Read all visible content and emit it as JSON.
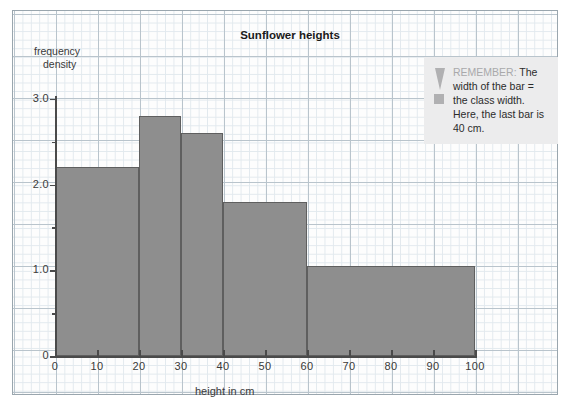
{
  "chart_data": {
    "type": "bar",
    "title": "Sunflower heights",
    "xlabel": "height in cm",
    "ylabel": "frequency density",
    "ylabel_line1": "frequency",
    "ylabel_line2": "density",
    "xlim": [
      0,
      100
    ],
    "ylim": [
      0,
      3.2
    ],
    "grid": true,
    "legend": "none",
    "bar_color": "#8e8e8e",
    "bar_edge_color": "#5f5f5f",
    "grid_major_color": "#b9c4cc",
    "grid_minor_color": "#e2e9ee",
    "x_ticks": [
      0,
      10,
      20,
      30,
      40,
      50,
      60,
      70,
      80,
      90,
      100
    ],
    "x_tick_labels": [
      "0",
      "10",
      "20",
      "30",
      "40",
      "50",
      "60",
      "70",
      "80",
      "90",
      "100"
    ],
    "y_ticks": [
      0,
      1.0,
      2.0,
      3.0
    ],
    "y_tick_labels": [
      "0",
      "1.0",
      "2.0",
      "3.0"
    ],
    "y_minor_ticks": [
      0.5,
      1.5,
      2.5
    ],
    "bins": [
      {
        "label": "0-20",
        "x0": 0,
        "x1": 20,
        "class_width": 20,
        "density": 2.2,
        "frequency": 44
      },
      {
        "label": "20-30",
        "x0": 20,
        "x1": 30,
        "class_width": 10,
        "density": 2.8,
        "frequency": 28
      },
      {
        "label": "30-40",
        "x0": 30,
        "x1": 40,
        "class_width": 10,
        "density": 2.6,
        "frequency": 26
      },
      {
        "label": "40-60",
        "x0": 40,
        "x1": 60,
        "class_width": 20,
        "density": 1.8,
        "frequency": 36
      },
      {
        "label": "60-100",
        "x0": 60,
        "x1": 100,
        "class_width": 40,
        "density": 1.05,
        "frequency": 42
      }
    ]
  },
  "callout": {
    "icon": "exclamation-mark-icon",
    "keyword": "REMEMBER:",
    "body": " The width of the bar = the class width. Here, the last bar is 40 cm.",
    "background": "#ececed",
    "keyword_color": "#a9a9ab"
  }
}
